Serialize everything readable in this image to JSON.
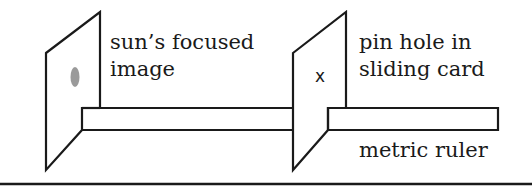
{
  "diagram": {
    "labels": {
      "sun_image_line1": "sun’s focused",
      "sun_image_line2": "image",
      "pinhole_line1": "pin hole in",
      "pinhole_line2": "sliding card",
      "ruler": "metric ruler",
      "pin_mark": "x"
    },
    "colors": {
      "stroke": "#1a1a1a",
      "sun_spot": "#9a9a9a",
      "background": "#ffffff"
    }
  }
}
